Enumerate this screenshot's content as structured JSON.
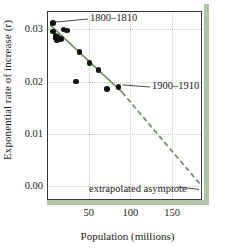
{
  "chart_data": {
    "type": "scatter",
    "title": "",
    "xlabel": "Population (millions)",
    "ylabel": "Exponential rate of increase (r)",
    "xlim": [
      0,
      186
    ],
    "ylim": [
      -0.0026,
      0.0335
    ],
    "xticks": [
      50,
      100,
      150
    ],
    "xticklabels": [
      "50",
      "100",
      "150"
    ],
    "yticks": [
      0.0,
      0.01,
      0.02,
      0.03
    ],
    "yticklabels": [
      "0.00",
      "0.01",
      "0.02",
      "0.03"
    ],
    "grid": true,
    "legend": null,
    "points": [
      {
        "x": 7,
        "y": 0.0312
      },
      {
        "x": 7,
        "y": 0.0296
      },
      {
        "x": 10,
        "y": 0.0288
      },
      {
        "x": 11,
        "y": 0.0283
      },
      {
        "x": 12,
        "y": 0.028
      },
      {
        "x": 12,
        "y": 0.0286
      },
      {
        "x": 17,
        "y": 0.0281
      },
      {
        "x": 20,
        "y": 0.03
      },
      {
        "x": 24,
        "y": 0.0298
      },
      {
        "x": 35,
        "y": 0.02
      },
      {
        "x": 39,
        "y": 0.0257
      },
      {
        "x": 51,
        "y": 0.0236
      },
      {
        "x": 62,
        "y": 0.0222
      },
      {
        "x": 72,
        "y": 0.0186
      },
      {
        "x": 86,
        "y": 0.019
      }
    ],
    "fit_line": {
      "style": "solid-then-dashed",
      "color": "#6f8f63",
      "solid_from": {
        "x": 4,
        "y": 0.0308
      },
      "solid_to": {
        "x": 90,
        "y": 0.018
      },
      "dashed_to": {
        "x": 186,
        "y": 0.0
      }
    },
    "annotations": [
      {
        "label": "1800–1810",
        "points_to": {
          "x": 7,
          "y": 0.0312
        }
      },
      {
        "label": "1900–1910",
        "points_to": {
          "x": 86,
          "y": 0.019
        }
      },
      {
        "label": "extrapolated asymptote",
        "points_to": {
          "x": 186,
          "y": 0.0
        }
      }
    ]
  },
  "accent_color": "#adc6a4",
  "line_color": "#6f8f63",
  "point_color": "#111111"
}
